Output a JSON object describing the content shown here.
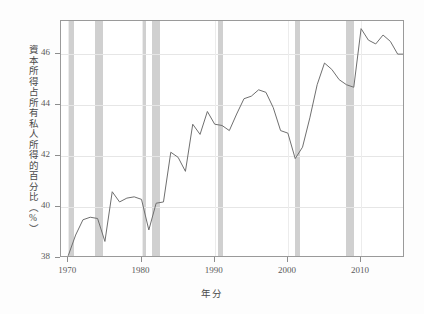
{
  "chart_data": {
    "type": "line",
    "title": "",
    "xlabel": "年分",
    "ylabel": "資本所得占所有私人所得的百分比（%）",
    "xlim": [
      1969,
      2016
    ],
    "ylim": [
      38,
      47.3
    ],
    "xticks": [
      1970,
      1980,
      1990,
      2000,
      2010
    ],
    "xtick_labels": [
      "1970",
      "1980",
      "1990",
      "2000",
      "2010"
    ],
    "yticks": [
      38,
      40,
      42,
      44,
      46
    ],
    "ytick_labels": [
      "38",
      "40",
      "42",
      "44",
      "46"
    ],
    "grid": true,
    "legend": "none",
    "series": [
      {
        "name": "資本所得占所有私人所得的百分比",
        "color": "#6f6f6f",
        "x": [
          1970,
          1971,
          1972,
          1973,
          1974,
          1975,
          1976,
          1977,
          1978,
          1979,
          1980,
          1981,
          1982,
          1983,
          1984,
          1985,
          1986,
          1987,
          1988,
          1989,
          1990,
          1991,
          1992,
          1993,
          1994,
          1995,
          1996,
          1997,
          1998,
          1999,
          2000,
          2001,
          2002,
          2003,
          2004,
          2005,
          2006,
          2007,
          2008,
          2009,
          2010,
          2011,
          2012,
          2013,
          2014,
          2015,
          2016
        ],
        "y": [
          38.1,
          38.9,
          39.5,
          39.6,
          39.55,
          38.65,
          40.6,
          40.2,
          40.35,
          40.4,
          40.3,
          39.1,
          40.15,
          40.2,
          42.15,
          41.95,
          41.4,
          43.25,
          42.85,
          43.75,
          43.25,
          43.2,
          43.0,
          43.65,
          44.25,
          44.35,
          44.6,
          44.5,
          43.9,
          43.0,
          42.9,
          41.9,
          42.35,
          43.5,
          44.8,
          45.65,
          45.4,
          45.0,
          44.8,
          44.7,
          47.0,
          46.55,
          46.4,
          46.75,
          46.5,
          46.0,
          46.0
        ]
      }
    ],
    "shaded_bands": {
      "label": "recession-band",
      "color": "#c3c3c3",
      "ranges": [
        [
          1970.0,
          1970.8
        ],
        [
          1973.7,
          1974.7
        ],
        [
          1980.0,
          1980.55
        ],
        [
          1981.4,
          1982.5
        ],
        [
          1990.5,
          1991.1
        ],
        [
          2001.0,
          2001.6
        ],
        [
          2007.95,
          2009.1
        ]
      ]
    }
  }
}
